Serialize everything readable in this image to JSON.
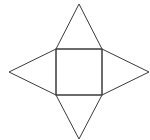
{
  "diagram": {
    "title": "",
    "stroke_color": "#3a3a3a",
    "background_color": "#ffffff",
    "stroke_width": 1,
    "square": {
      "x": 56,
      "y": 49,
      "width": 46,
      "height": 46
    },
    "triangles": [
      {
        "name": "top",
        "points": "56,49 79,4 102,49"
      },
      {
        "name": "right",
        "points": "102,49 149,72 102,95"
      },
      {
        "name": "bottom",
        "points": "56,95 79,139 102,95"
      },
      {
        "name": "left",
        "points": "56,49 9,72 56,95"
      }
    ]
  }
}
